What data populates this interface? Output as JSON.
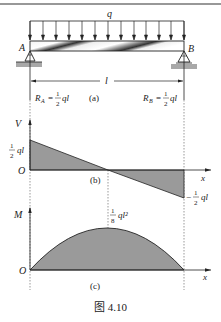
{
  "figure": {
    "caption": "图 4.10",
    "panels": {
      "a": {
        "label": "(a)",
        "load_label": "q",
        "support_left": "A",
        "support_right": "B",
        "span_label": "l",
        "reaction_left": {
          "symbol": "R",
          "sub": "A",
          "num": "1",
          "den": "2",
          "tail": "ql"
        },
        "reaction_right": {
          "symbol": "R",
          "sub": "B",
          "num": "1",
          "den": "2",
          "tail": "ql"
        }
      },
      "b": {
        "label": "(b)",
        "y_axis": "V",
        "x_axis": "x",
        "origin": "O",
        "pos_value": {
          "num": "1",
          "den": "2",
          "tail": "ql"
        },
        "neg_value": {
          "sign": "−",
          "num": "1",
          "den": "2",
          "tail": "ql"
        }
      },
      "c": {
        "label": "(c)",
        "y_axis": "M",
        "x_axis": "x",
        "origin": "O",
        "peak_value": {
          "num": "1",
          "den": "8",
          "tail": "ql²"
        }
      }
    }
  },
  "colors": {
    "fill": "#9a9a9a",
    "line": "#222222",
    "ground": "#a8a8a8"
  }
}
